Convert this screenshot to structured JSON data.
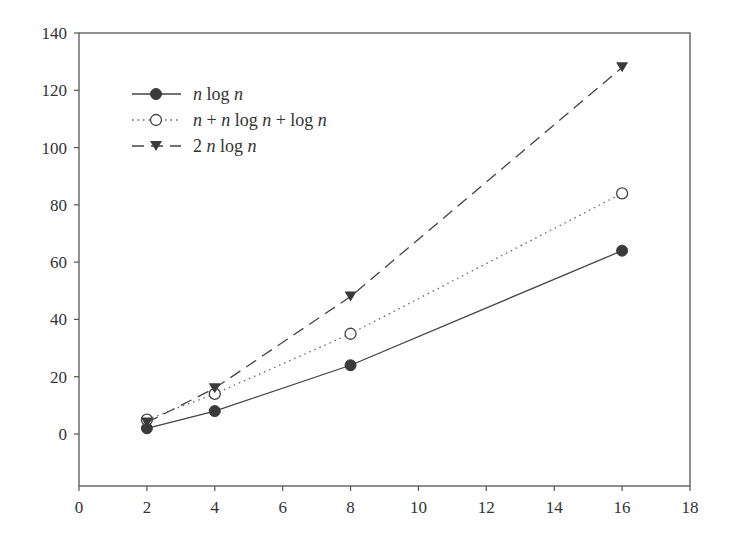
{
  "chart_data": {
    "type": "line",
    "title": "",
    "xlabel": "",
    "ylabel": "",
    "xlim": [
      0,
      18
    ],
    "ylim": [
      -18,
      140
    ],
    "xticks": [
      0,
      2,
      4,
      6,
      8,
      10,
      12,
      14,
      16,
      18
    ],
    "yticks": [
      0,
      20,
      40,
      60,
      80,
      100,
      120,
      140
    ],
    "grid": false,
    "legend_position": "upper left",
    "x": [
      2,
      4,
      8,
      16
    ],
    "series": [
      {
        "name": "n log n",
        "values": [
          2,
          8,
          24,
          64
        ],
        "line_style": "solid",
        "marker": "filled-circle",
        "color": "#444444"
      },
      {
        "name": "n + n log n + log n",
        "values": [
          5,
          14,
          35,
          84
        ],
        "line_style": "dotted",
        "marker": "open-circle",
        "color": "#666666"
      },
      {
        "name": "2 n log n",
        "values": [
          4,
          16,
          48,
          128
        ],
        "line_style": "dashed",
        "marker": "filled-triangle-down",
        "color": "#444444"
      }
    ]
  },
  "legend": {
    "items": [
      {
        "parts": [
          [
            "i",
            "n"
          ],
          [
            "r",
            " log "
          ],
          [
            "i",
            "n"
          ]
        ]
      },
      {
        "parts": [
          [
            "i",
            "n"
          ],
          [
            "r",
            " + "
          ],
          [
            "i",
            "n"
          ],
          [
            "r",
            " log "
          ],
          [
            "i",
            "n"
          ],
          [
            "r",
            " + log "
          ],
          [
            "i",
            "n"
          ]
        ]
      },
      {
        "parts": [
          [
            "r",
            "2 "
          ],
          [
            "i",
            "n"
          ],
          [
            "r",
            " log "
          ],
          [
            "i",
            "n"
          ]
        ]
      }
    ]
  }
}
